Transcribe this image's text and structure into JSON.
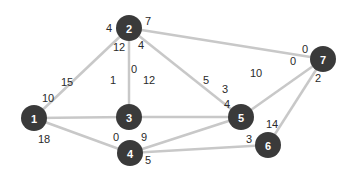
{
  "graph": {
    "node_color": "#3a3a3a",
    "edge_color": "#c8c8c8",
    "nodes": [
      {
        "id": "1",
        "x": 34,
        "y": 118
      },
      {
        "id": "2",
        "x": 129,
        "y": 28
      },
      {
        "id": "3",
        "x": 129,
        "y": 117
      },
      {
        "id": "4",
        "x": 130,
        "y": 153
      },
      {
        "id": "5",
        "x": 241,
        "y": 117
      },
      {
        "id": "6",
        "x": 268,
        "y": 145
      },
      {
        "id": "7",
        "x": 323,
        "y": 59
      }
    ],
    "edges": [
      {
        "from": "1",
        "to": "2",
        "from_weight": "10",
        "to_weight": "4",
        "fw": [
          48,
          98
        ],
        "tw": [
          109,
          28
        ]
      },
      {
        "from": "1",
        "to": "3",
        "from_weight": "15",
        "to_weight": "1",
        "fw": [
          67,
          82
        ],
        "tw": [
          113,
          80
        ]
      },
      {
        "from": "1",
        "to": "4",
        "from_weight": "18",
        "to_weight": "0",
        "fw": [
          44,
          139
        ],
        "tw": [
          116,
          137
        ]
      },
      {
        "from": "2",
        "to": "3",
        "from_weight": "12",
        "to_weight": "0",
        "fw": [
          119,
          47
        ],
        "tw": [
          134,
          69
        ]
      },
      {
        "from": "2",
        "to": "5",
        "from_weight": "4",
        "to_weight": "3",
        "fw": [
          141,
          45
        ],
        "tw": [
          225,
          89
        ]
      },
      {
        "from": "2",
        "to": "7",
        "from_weight": "7",
        "to_weight": "0",
        "fw": [
          148,
          21
        ],
        "tw": [
          305,
          49
        ]
      },
      {
        "from": "3",
        "to": "5",
        "from_weight": "12",
        "to_weight": "5",
        "fw": [
          149,
          80
        ],
        "tw": [
          206,
          80
        ]
      },
      {
        "from": "4",
        "to": "5",
        "from_weight": "9",
        "to_weight": "4",
        "fw": [
          144,
          137
        ],
        "tw": [
          227,
          104
        ]
      },
      {
        "from": "4",
        "to": "6",
        "from_weight": "5",
        "to_weight": "3",
        "fw": [
          148,
          160
        ],
        "tw": [
          249,
          139
        ]
      },
      {
        "from": "5",
        "to": "7",
        "from_weight": "10",
        "to_weight": "0",
        "fw": [
          256,
          73
        ],
        "tw": [
          293,
          61
        ]
      },
      {
        "from": "6",
        "to": "7",
        "from_weight": "14",
        "to_weight": "2",
        "fw": [
          272,
          124
        ],
        "tw": [
          318,
          78
        ]
      }
    ]
  }
}
